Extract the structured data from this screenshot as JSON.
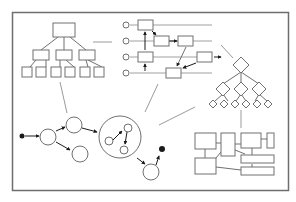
{
  "diagram": {
    "title": "",
    "colors": {
      "background": "#ffffff",
      "frame": "#6e6e6e",
      "stroke": "#707070",
      "connector": "#9a9a9a",
      "fill": "#ffffff",
      "dot": "#1a1a1a"
    },
    "frame": {
      "x": 12,
      "y": 12,
      "w": 276,
      "h": 178
    },
    "panels": [
      {
        "name": "tree-hierarchy",
        "description": "Rectangle tree: 1 root, 3 children, 6 leaves"
      },
      {
        "name": "swimlane-flow",
        "description": "4 horizontal lanes with circle inputs and linked boxes"
      },
      {
        "name": "diamond-tree",
        "description": "Diamond decision tree: 1 root, 3 children, 6 leaves"
      },
      {
        "name": "state-graph",
        "description": "Circle state graph with nested composite state"
      },
      {
        "name": "block-layout",
        "description": "Block diagram of connected rectangles"
      }
    ],
    "labels": []
  }
}
